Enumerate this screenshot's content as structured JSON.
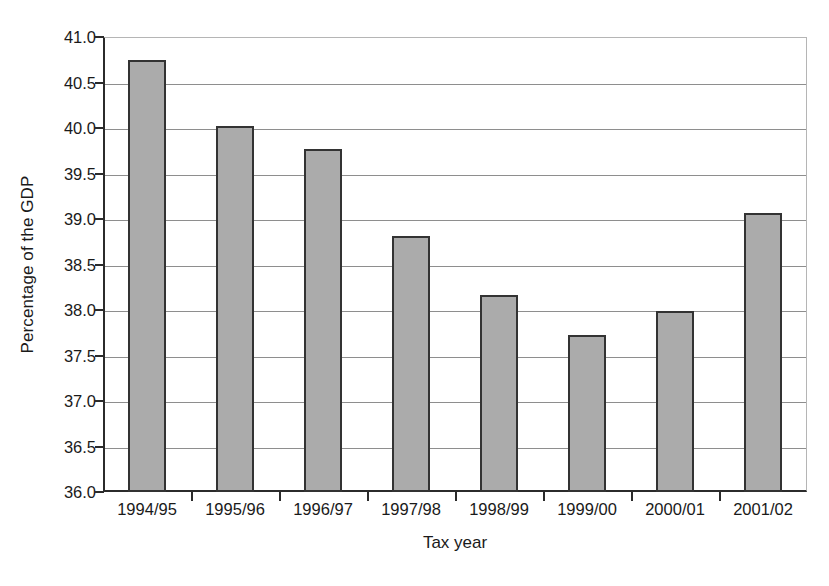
{
  "chart_data": {
    "type": "bar",
    "title": "",
    "xlabel": "Tax year",
    "ylabel": "Percentage of the GDP",
    "categories": [
      "1994/95",
      "1995/96",
      "1996/97",
      "1997/98",
      "1998/99",
      "1999/00",
      "2000/01",
      "2001/02"
    ],
    "values": [
      40.75,
      40.02,
      39.77,
      38.81,
      38.17,
      37.73,
      37.99,
      39.07
    ],
    "ylim": [
      36.0,
      41.0
    ],
    "ytick_values": [
      36.0,
      36.5,
      37.0,
      37.5,
      38.0,
      38.5,
      39.0,
      39.5,
      40.0,
      40.5,
      41.0
    ],
    "ytick_labels": [
      "36.0",
      "36.5",
      "37.0",
      "37.5",
      "38.0",
      "38.5",
      "39.0",
      "39.5",
      "40.0",
      "40.5",
      "41.0"
    ],
    "grid": true,
    "grid_axis": "y",
    "legend": false,
    "legend_position": "none",
    "bar_fill_color": "#ababab",
    "bar_border_color": "#333333",
    "gridline_color": "#8e8e8e",
    "axis_color": "#2b2b2b",
    "background_color": "#ffffff"
  }
}
